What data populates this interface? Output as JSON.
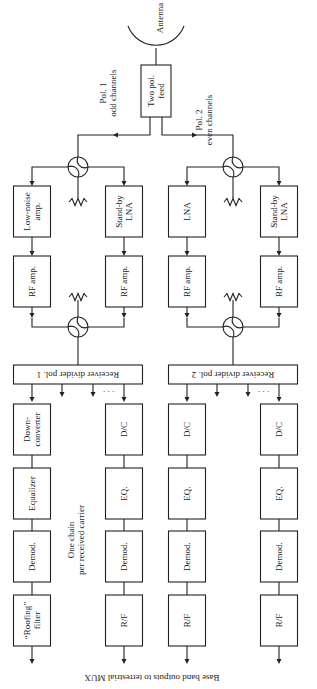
{
  "diagram": {
    "antenna_label": "Antenna",
    "feed": [
      "Two pol.",
      "feed"
    ],
    "pol1_label": [
      "Pol. 1",
      "odd channels"
    ],
    "pol2_label": [
      "Pol. 2",
      "even channels"
    ],
    "pol1": {
      "main_lna": [
        "Low-noise",
        "amp."
      ],
      "standby_lna": [
        "Stand-by",
        "LNA"
      ],
      "rf_amp_a": [
        "RF amp."
      ],
      "rf_amp_b": [
        "RF amp."
      ],
      "divider": "Receiver divider pol. 1",
      "chain_a": [
        [
          "Down-",
          "converter"
        ],
        [
          "Equalizer"
        ],
        [
          "Demod."
        ],
        [
          "“Roofing”",
          "filter"
        ]
      ],
      "chain_b": [
        [
          "D/C"
        ],
        [
          "EQ."
        ],
        [
          "Demod."
        ],
        [
          "R/F"
        ]
      ]
    },
    "pol2": {
      "main_lna": [
        "LNA"
      ],
      "standby_lna": [
        "Stand-by",
        "LNA"
      ],
      "rf_amp_a": [
        "RF amp."
      ],
      "rf_amp_b": [
        "RF amp."
      ],
      "divider": "Receiver divider pol. 2",
      "chain_a": [
        [
          "D/C"
        ],
        [
          "EQ."
        ],
        [
          "Demod."
        ],
        [
          "R/F"
        ]
      ],
      "chain_b": [
        [
          "D/C"
        ],
        [
          "EQ."
        ],
        [
          "Demod."
        ],
        [
          "R/F"
        ]
      ]
    },
    "chain_note": [
      "One chain",
      "per received carrier"
    ],
    "ellipsis": ". . .",
    "output_caption": "Base band outputs to terrestrial MUX"
  }
}
